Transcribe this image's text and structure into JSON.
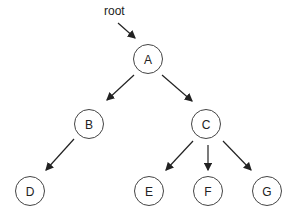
{
  "diagram": {
    "type": "tree",
    "pointer_label": "root",
    "nodes": [
      {
        "id": "A",
        "label": "A",
        "x": 148,
        "y": 59
      },
      {
        "id": "B",
        "label": "B",
        "x": 89,
        "y": 124
      },
      {
        "id": "C",
        "label": "C",
        "x": 206,
        "y": 124
      },
      {
        "id": "D",
        "label": "D",
        "x": 30,
        "y": 191
      },
      {
        "id": "E",
        "label": "E",
        "x": 149,
        "y": 191
      },
      {
        "id": "F",
        "label": "F",
        "x": 208,
        "y": 191
      },
      {
        "id": "G",
        "label": "G",
        "x": 267,
        "y": 191
      }
    ],
    "edges": [
      {
        "from": "A",
        "to": "B"
      },
      {
        "from": "A",
        "to": "C"
      },
      {
        "from": "B",
        "to": "D"
      },
      {
        "from": "C",
        "to": "E"
      },
      {
        "from": "C",
        "to": "F"
      },
      {
        "from": "C",
        "to": "G"
      }
    ],
    "colors": {
      "stroke": "#444444",
      "text": "#222222",
      "background": "#ffffff"
    }
  }
}
